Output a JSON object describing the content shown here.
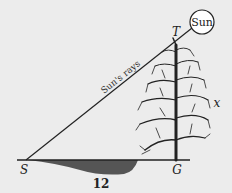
{
  "diagram": {
    "sun_label": "Sun",
    "rays_label": "Sun's rays",
    "points": {
      "S": "S",
      "T": "T",
      "G": "G"
    },
    "tree_height_label": "x",
    "shadow_length_label": "12",
    "colors": {
      "background": "#ececec",
      "line": "#222222",
      "shadow": "#555555",
      "sun_fill": "#ffffff"
    }
  }
}
